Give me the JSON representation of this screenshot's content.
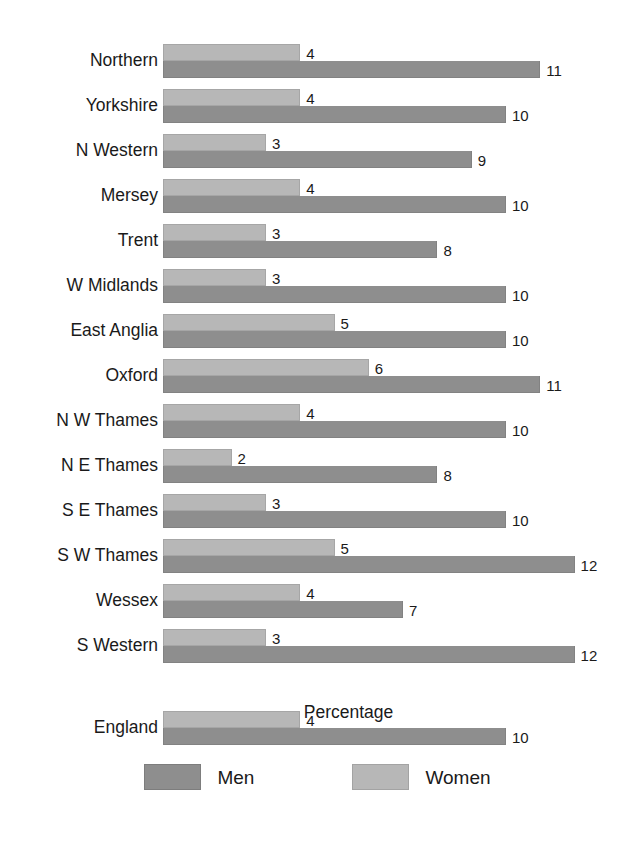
{
  "chart_data": {
    "type": "bar",
    "orientation": "horizontal",
    "title": "",
    "xlabel": "Percentage",
    "ylabel": "",
    "xlim": [
      0,
      13
    ],
    "grid": false,
    "legend_position": "bottom",
    "categories": [
      "Northern",
      "Yorkshire",
      "N Western",
      "Mersey",
      "Trent",
      "W Midlands",
      "East Anglia",
      "Oxford",
      "N W Thames",
      "N E Thames",
      "S E Thames",
      "S W Thames",
      "Wessex",
      "S Western"
    ],
    "series": [
      {
        "name": "Men",
        "color": "#8e8e8e",
        "values": [
          11,
          10,
          9,
          10,
          8,
          10,
          10,
          11,
          10,
          8,
          10,
          12,
          7,
          12
        ]
      },
      {
        "name": "Women",
        "color": "#b7b7b7",
        "values": [
          4,
          4,
          3,
          4,
          3,
          3,
          5,
          6,
          4,
          2,
          3,
          5,
          4,
          3
        ]
      }
    ],
    "summary_row": {
      "category": "England",
      "men": 10,
      "women": 4
    },
    "data_labels": {
      "Northern": {
        "women": "4",
        "men": "11"
      },
      "Yorkshire": {
        "women": "4",
        "men": "10"
      },
      "N Western": {
        "women": "3",
        "men": "9"
      },
      "Mersey": {
        "women": "4",
        "men": "10"
      },
      "Trent": {
        "women": "3",
        "men": "8"
      },
      "W Midlands": {
        "women": "3",
        "men": "10"
      },
      "East Anglia": {
        "women": "5",
        "men": "10"
      },
      "Oxford": {
        "women": "6",
        "men": "11"
      },
      "N W Thames": {
        "women": "4",
        "men": "10"
      },
      "N E Thames": {
        "women": "2",
        "men": "8"
      },
      "S E Thames": {
        "women": "3",
        "men": "10"
      },
      "S W Thames": {
        "women": "5",
        "men": "12"
      },
      "Wessex": {
        "women": "4",
        "men": "7"
      },
      "S Western": {
        "women": "3",
        "men": "12"
      },
      "England": {
        "women": "4",
        "men": "10"
      }
    }
  },
  "axis": {
    "x_title": "Percentage"
  },
  "legend": {
    "men_label": "Men",
    "women_label": "Women",
    "men_color": "#8e8e8e",
    "women_color": "#b7b7b7"
  }
}
